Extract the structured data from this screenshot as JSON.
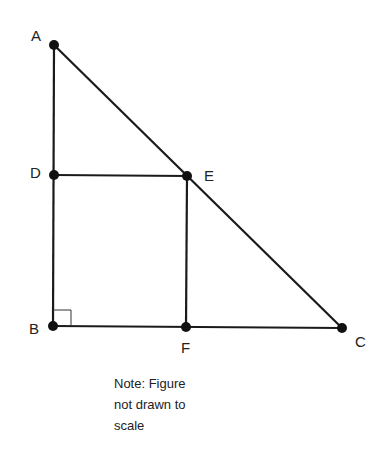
{
  "figure": {
    "points": [
      {
        "name": "A",
        "x": 54,
        "y": 45
      },
      {
        "name": "D",
        "x": 54,
        "y": 175
      },
      {
        "name": "E",
        "x": 187,
        "y": 176
      },
      {
        "name": "B",
        "x": 53,
        "y": 326
      },
      {
        "name": "F",
        "x": 186,
        "y": 327
      },
      {
        "name": "C",
        "x": 342,
        "y": 328
      }
    ],
    "segments": [
      "AB",
      "BC",
      "AC",
      "DE",
      "EF"
    ],
    "right_angle_at": "B",
    "labels": {
      "A": "A",
      "B": "B",
      "C": "C",
      "D": "D",
      "E": "E",
      "F": "F"
    }
  },
  "note": {
    "line1": "Note: Figure",
    "line2": "not drawn to",
    "line3": "scale"
  },
  "colors": {
    "stroke": "#1a1a1a",
    "background": "#ffffff"
  }
}
